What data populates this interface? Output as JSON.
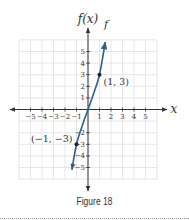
{
  "chart_data": {
    "type": "line",
    "title": "",
    "caption": "Figure 18",
    "xlabel": "x",
    "ylabel": "f(x)",
    "curve_label": "f",
    "xlim": [
      -6,
      6
    ],
    "ylim": [
      -6,
      6
    ],
    "grid": true,
    "x_ticks": [
      -5,
      -4,
      -3,
      -2,
      -1,
      1,
      2,
      3,
      4,
      5
    ],
    "y_ticks": [
      -5,
      -4,
      -3,
      -2,
      1,
      2,
      3,
      4,
      5
    ],
    "x_tick_labels": [
      "−5",
      "−4",
      "−3",
      "−2",
      "−1",
      "1",
      "2",
      "3",
      "4",
      "5"
    ],
    "y_tick_labels": [
      "−5",
      "−4",
      "−3",
      "−2",
      "1",
      "2",
      "3",
      "4",
      "5"
    ],
    "series": [
      {
        "name": "f",
        "color": "#2f5f8a",
        "x": [
          -1.4,
          -1,
          -0.5,
          0,
          0.5,
          1,
          1.5
        ],
        "y": [
          -5.2,
          -3,
          -1.4,
          0,
          1.4,
          3,
          5.8
        ],
        "arrows": "both"
      }
    ],
    "points": [
      {
        "x": 1,
        "y": 3,
        "label": "(1, 3)"
      },
      {
        "x": -1,
        "y": -3,
        "label": "(−1, −3)"
      }
    ]
  },
  "colors": {
    "grid": "#dcdcdc",
    "axis": "#333333",
    "curve": "#2f5f8a"
  }
}
